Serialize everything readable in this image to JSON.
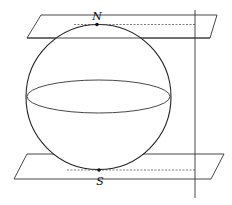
{
  "figure": {
    "labels": {
      "north": "N",
      "south": "S"
    },
    "colors": {
      "stroke": "#222222",
      "dashed": "#444444",
      "background": "#ffffff"
    }
  }
}
